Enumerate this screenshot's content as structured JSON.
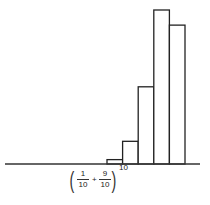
{
  "chart_data": {
    "type": "bar",
    "title": "",
    "xlabel": "(1/10 + 9/10)^10",
    "ylabel": "",
    "categories": [
      "6",
      "7",
      "8",
      "9",
      "10"
    ],
    "values": [
      0.011,
      0.057,
      0.194,
      0.387,
      0.349
    ],
    "grid": false,
    "legend": null,
    "colors": {
      "stroke": "#222222",
      "fill": "#ffffff"
    }
  },
  "label": {
    "open_paren": "(",
    "close_paren": ")",
    "frac1_num": "1",
    "frac1_den": "10",
    "plus": "+",
    "frac2_num": "9",
    "frac2_den": "10",
    "exponent": "10"
  }
}
